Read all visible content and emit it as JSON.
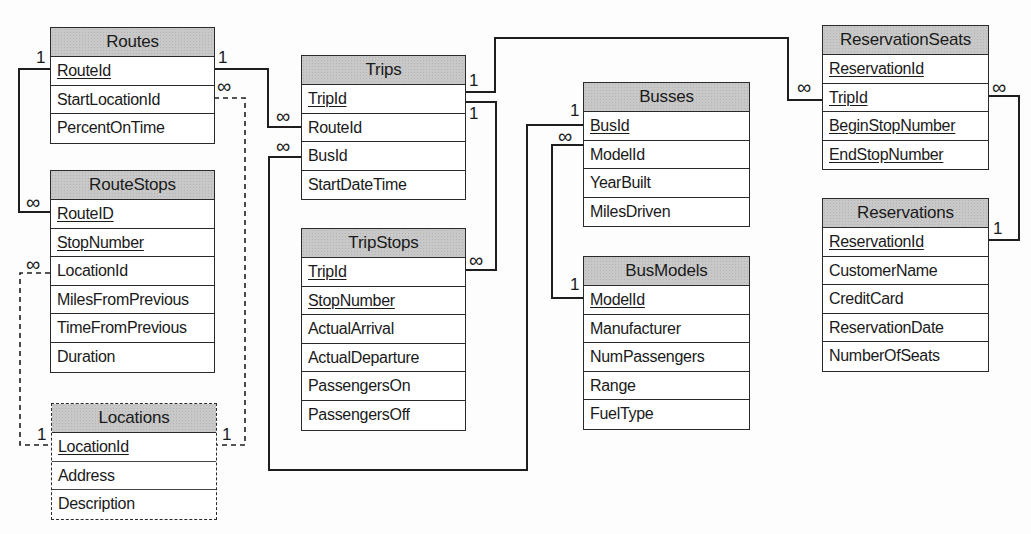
{
  "diagram": {
    "type": "entity-relationship",
    "tables": {
      "routes": {
        "name": "Routes",
        "fields": [
          {
            "name": "RouteId",
            "pk": true
          },
          {
            "name": "StartLocationId",
            "pk": false
          },
          {
            "name": "PercentOnTime",
            "pk": false
          }
        ]
      },
      "route_stops": {
        "name": "RouteStops",
        "fields": [
          {
            "name": "RouteID",
            "pk": true
          },
          {
            "name": "StopNumber",
            "pk": true
          },
          {
            "name": "LocationId",
            "pk": false
          },
          {
            "name": "MilesFromPrevious",
            "pk": false
          },
          {
            "name": "TimeFromPrevious",
            "pk": false
          },
          {
            "name": "Duration",
            "pk": false
          }
        ]
      },
      "locations": {
        "name": "Locations",
        "dashed": true,
        "fields": [
          {
            "name": "LocationId",
            "pk": true
          },
          {
            "name": "Address",
            "pk": false
          },
          {
            "name": "Description",
            "pk": false
          }
        ]
      },
      "trips": {
        "name": "Trips",
        "fields": [
          {
            "name": "TripId",
            "pk": true
          },
          {
            "name": "RouteId",
            "pk": false
          },
          {
            "name": "BusId",
            "pk": false
          },
          {
            "name": "StartDateTime",
            "pk": false
          }
        ]
      },
      "trip_stops": {
        "name": "TripStops",
        "fields": [
          {
            "name": "TripId",
            "pk": true
          },
          {
            "name": "StopNumber",
            "pk": true
          },
          {
            "name": "ActualArrival",
            "pk": false
          },
          {
            "name": "ActualDeparture",
            "pk": false
          },
          {
            "name": "PassengersOn",
            "pk": false
          },
          {
            "name": "PassengersOff",
            "pk": false
          }
        ]
      },
      "busses": {
        "name": "Busses",
        "fields": [
          {
            "name": "BusId",
            "pk": true
          },
          {
            "name": "ModelId",
            "pk": false
          },
          {
            "name": "YearBuilt",
            "pk": false
          },
          {
            "name": "MilesDriven",
            "pk": false
          }
        ]
      },
      "bus_models": {
        "name": "BusModels",
        "fields": [
          {
            "name": "ModelId",
            "pk": true
          },
          {
            "name": "Manufacturer",
            "pk": false
          },
          {
            "name": "NumPassengers",
            "pk": false
          },
          {
            "name": "Range",
            "pk": false
          },
          {
            "name": "FuelType",
            "pk": false
          }
        ]
      },
      "reservation_seats": {
        "name": "ReservationSeats",
        "fields": [
          {
            "name": "ReservationId",
            "pk": true
          },
          {
            "name": "TripId",
            "pk": true
          },
          {
            "name": "BeginStopNumber",
            "pk": true
          },
          {
            "name": "EndStopNumber",
            "pk": true
          }
        ]
      },
      "reservations": {
        "name": "Reservations",
        "fields": [
          {
            "name": "ReservationId",
            "pk": true
          },
          {
            "name": "CustomerName",
            "pk": false
          },
          {
            "name": "CreditCard",
            "pk": false
          },
          {
            "name": "ReservationDate",
            "pk": false
          },
          {
            "name": "NumberOfSeats",
            "pk": false
          }
        ]
      }
    },
    "cardinality": {
      "one": "1",
      "many": "∞"
    },
    "relationships": [
      {
        "from": "Routes.RouteId",
        "from_card": "1",
        "to": "RouteStops.RouteID",
        "to_card": "∞",
        "style": "solid"
      },
      {
        "from": "Routes.RouteId",
        "from_card": "1",
        "to": "Trips.RouteId",
        "to_card": "∞",
        "style": "solid"
      },
      {
        "from": "Locations.LocationId",
        "from_card": "1",
        "to": "Routes.StartLocationId",
        "to_card": "∞",
        "style": "dashed"
      },
      {
        "from": "Locations.LocationId",
        "from_card": "1",
        "to": "RouteStops.LocationId",
        "to_card": "∞",
        "style": "dashed"
      },
      {
        "from": "Trips.TripId",
        "from_card": "1",
        "to": "ReservationSeats.TripId",
        "to_card": "∞",
        "style": "solid"
      },
      {
        "from": "Trips.TripId",
        "from_card": "1",
        "to": "TripStops.TripId",
        "to_card": "∞",
        "style": "solid"
      },
      {
        "from": "Busses.BusId",
        "from_card": "1",
        "to": "Trips.BusId",
        "to_card": "∞",
        "style": "solid"
      },
      {
        "from": "BusModels.ModelId",
        "from_card": "1",
        "to": "Busses.ModelId",
        "to_card": "∞",
        "style": "solid"
      },
      {
        "from": "Reservations.ReservationId",
        "from_card": "1",
        "to": "ReservationSeats.ReservationId",
        "to_card": "∞",
        "style": "solid"
      }
    ]
  }
}
